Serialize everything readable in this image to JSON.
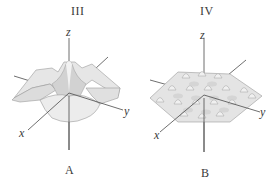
{
  "figure": {
    "panels": [
      {
        "id": "left",
        "roman_label": "III",
        "caption": "A",
        "surface": "central peak with ridges along axes",
        "axes": {
          "x": "x",
          "y": "y",
          "z": "z"
        }
      },
      {
        "id": "right",
        "roman_label": "IV",
        "caption": "B",
        "surface": "periodic egg-crate waves",
        "axes": {
          "x": "x",
          "y": "y",
          "z": "z"
        }
      }
    ],
    "colors": {
      "background": "#ffffff",
      "surface_fill": "#e6e6e6",
      "surface_shade": "#c8c8c8",
      "surface_edge": "#9a9a9a",
      "axis_line": "#4a4a4a"
    }
  }
}
